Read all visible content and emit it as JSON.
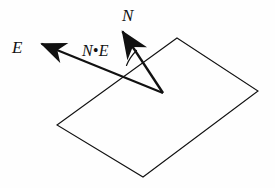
{
  "figure": {
    "background_color": "#fefefe",
    "stroke_color": "#111111",
    "labels": {
      "normal_vector": "N",
      "eye_vector": "E",
      "dot_product": "N•E"
    },
    "geometry": {
      "plane": {
        "name": "surface-plane-parallelogram",
        "points": "177,38 258,91 143,177 57,125",
        "stroke_width": 1.1,
        "fill": "none"
      },
      "origin": {
        "x": 163,
        "y": 93
      },
      "normal_vector": {
        "name": "normal-vector-N",
        "from_x": 163,
        "from_y": 93,
        "to_x": 113,
        "to_y": 17,
        "stroke_width": 2.4,
        "head_length": 22,
        "head_width": 11
      },
      "eye_vector": {
        "name": "eye-vector-E",
        "from_x": 163,
        "from_y": 93,
        "to_x": 27,
        "to_y": 38,
        "stroke_width": 2.2,
        "head_length": 20,
        "head_width": 10
      },
      "angle_arc": {
        "name": "angle-arc-between-N-and-E",
        "radius": 42,
        "stroke_width": 1.2,
        "path": "M 127 64 A 42 42 0 0 1 135 52"
      }
    }
  }
}
